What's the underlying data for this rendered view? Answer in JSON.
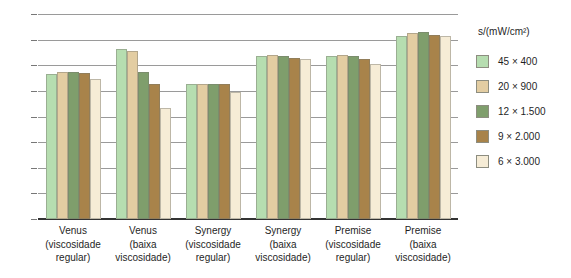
{
  "chart_data": {
    "type": "bar",
    "title": "",
    "xlabel": "",
    "ylabel": "",
    "ylim": [
      0,
      80
    ],
    "yticks": [
      0,
      10,
      20,
      30,
      40,
      50,
      60,
      70,
      80
    ],
    "grid": true,
    "legend_position": "right",
    "legend_title": "s/(mW/cm²)",
    "categories": [
      "Venus\n(viscosidade\nregular)",
      "Venus\n(baixa\nviscosidade)",
      "Synergy\n(viscosidade\nregular)",
      "Synergy\n(baixa\nviscosidade)",
      "Premise\n(viscosidade\nregular)",
      "Premise\n(baixa\nviscosidade)"
    ],
    "series": [
      {
        "name": "45 × 400",
        "color": "#b6ddb0",
        "values": [
          56.5,
          66.5,
          52.5,
          63.5,
          63.5,
          71.5
        ]
      },
      {
        "name": "20 × 900",
        "color": "#e3cda2",
        "values": [
          57.5,
          65.5,
          52.5,
          64.0,
          64.0,
          72.5
        ]
      },
      {
        "name": "12 × 1.500",
        "color": "#7f9e6c",
        "values": [
          57.5,
          57.5,
          52.5,
          63.5,
          63.5,
          73.0
        ]
      },
      {
        "name": "9 × 2.000",
        "color": "#a8834a",
        "values": [
          57.0,
          52.5,
          52.5,
          63.0,
          62.5,
          72.0
        ]
      },
      {
        "name": "6 × 3.000",
        "color": "#f6ecd6",
        "values": [
          54.5,
          43.5,
          49.5,
          62.5,
          60.5,
          71.5
        ]
      }
    ]
  }
}
